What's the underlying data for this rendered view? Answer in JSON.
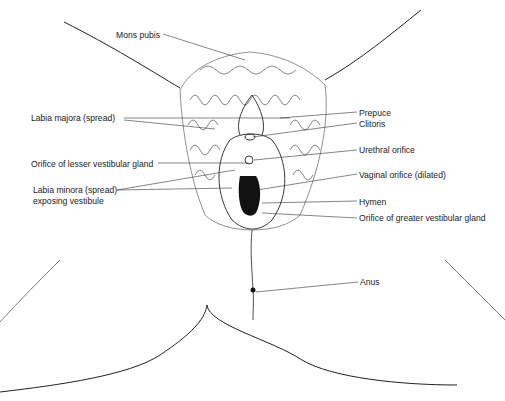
{
  "diagram": {
    "type": "anatomical-illustration"
  },
  "labels": {
    "mons_pubis": "Mons pubis",
    "labia_majora": "Labia majora (spread)",
    "orifice_lesser": "Orifice of lesser vestibular gland",
    "labia_minora_1": "Labia minora (spread)",
    "labia_minora_2": "exposing vestibule",
    "prepuce": "Prepuce",
    "clitoris": "Clitoris",
    "urethral": "Urethral orifice",
    "vaginal": "Vaginal orifice (dilated)",
    "hymen": "Hymen",
    "orifice_greater": "Orifice of greater vestibular gland",
    "anus": "Anus"
  }
}
